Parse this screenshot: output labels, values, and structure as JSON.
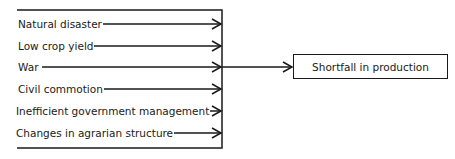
{
  "diagram": {
    "type": "cause-effect",
    "causes": [
      {
        "label": "Natural disaster"
      },
      {
        "label": "Low crop yield"
      },
      {
        "label": "War"
      },
      {
        "label": "Civil commotion"
      },
      {
        "label": "Inefficient government management"
      },
      {
        "label": "Changes in agrarian structure"
      }
    ],
    "effect": {
      "label": "Shortfall in production"
    },
    "colors": {
      "line": "#1a1a1a",
      "background": "#ffffff"
    }
  }
}
